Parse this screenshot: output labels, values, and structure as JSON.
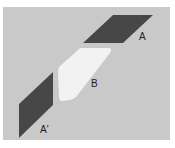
{
  "diagram": {
    "background_color": "#c9c9c9",
    "shapes": [
      {
        "id": "A",
        "label": "A",
        "fill": "#4a4a4a",
        "description": "dark textured parallelogram"
      },
      {
        "id": "B",
        "label": "B",
        "fill": "#f2f2f2",
        "description": "white rounded parallelogram"
      },
      {
        "id": "A-prime",
        "label": "A'",
        "fill": "#4a4a4a",
        "description": "dark textured parallelogram"
      }
    ]
  }
}
